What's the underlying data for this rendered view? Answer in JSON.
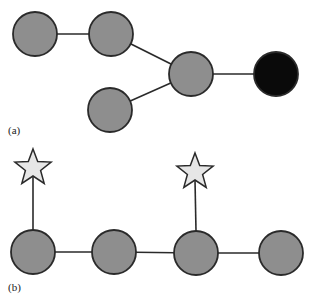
{
  "panels": [
    {
      "label": "(a)",
      "nodes": [
        {
          "id": "a1",
          "fill": "#8e8e8e"
        },
        {
          "id": "a2",
          "fill": "#8e8e8e"
        },
        {
          "id": "a3",
          "fill": "#8e8e8e"
        },
        {
          "id": "a4",
          "fill": "#8e8e8e"
        },
        {
          "id": "a5",
          "fill": "#0a0a0a"
        }
      ],
      "edges": [
        [
          "a1",
          "a2"
        ],
        [
          "a2",
          "a3"
        ],
        [
          "a4",
          "a3"
        ],
        [
          "a3",
          "a5"
        ]
      ]
    },
    {
      "label": "(b)",
      "nodes": [
        {
          "id": "b1",
          "fill": "#8e8e8e"
        },
        {
          "id": "b2",
          "fill": "#8e8e8e"
        },
        {
          "id": "b3",
          "fill": "#8e8e8e"
        },
        {
          "id": "b4",
          "fill": "#8e8e8e"
        }
      ],
      "stars": [
        {
          "id": "s1",
          "attached_to": "b1",
          "fill": "#e6e6e6"
        },
        {
          "id": "s2",
          "attached_to": "b3",
          "fill": "#e6e6e6"
        }
      ],
      "edges": [
        [
          "b1",
          "b2"
        ],
        [
          "b2",
          "b3"
        ],
        [
          "b3",
          "b4"
        ]
      ]
    }
  ],
  "colors": {
    "stroke": "#2a2a2a",
    "node_gray": "#8e8e8e",
    "node_black": "#0a0a0a",
    "star_fill": "#e6e6e6"
  }
}
